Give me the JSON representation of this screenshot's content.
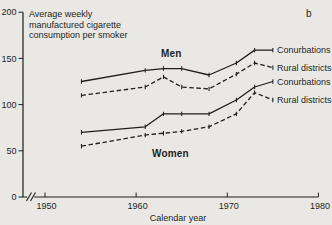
{
  "header": {
    "title_lines": [
      "Average weekly",
      "manufactured cigarette",
      "consumption per smoker"
    ],
    "panel_label": "b"
  },
  "colors": {
    "background": "#e9e8e4",
    "ink": "#1f1f1c"
  },
  "chart_data": {
    "type": "line",
    "title": "Average weekly manufactured cigarette consumption per smoker",
    "xlabel": "Calendar year",
    "ylabel": "",
    "xlim": [
      1947,
      1981
    ],
    "ylim": [
      0,
      200
    ],
    "xticks": [
      1950,
      1960,
      1970,
      1980
    ],
    "yticks": [
      0,
      50,
      100,
      150,
      200
    ],
    "grid": false,
    "x_axis_break_near_origin": true,
    "legend_position": "right-of-lines",
    "x": [
      1954,
      1961,
      1963,
      1965,
      1968,
      1971,
      1973,
      1975
    ],
    "group_labels": [
      "Men",
      "Women"
    ],
    "series": [
      {
        "id": "men-conurbations",
        "group": "Men",
        "label": "Conurbations",
        "style": "solid",
        "values": [
          125,
          137,
          139,
          139,
          132,
          145,
          159,
          159
        ]
      },
      {
        "id": "men-rural-districts",
        "group": "Men",
        "label": "Rural districts",
        "style": "dashed",
        "values": [
          110,
          119,
          130,
          119,
          117,
          133,
          145,
          140
        ]
      },
      {
        "id": "women-conurbations",
        "group": "Women",
        "label": "Conurbations",
        "style": "solid",
        "values": [
          70,
          76,
          90,
          90,
          90,
          105,
          119,
          125
        ]
      },
      {
        "id": "women-rural-districts",
        "group": "Women",
        "label": "Rural districts",
        "style": "dashed",
        "values": [
          55,
          67,
          69,
          71,
          76,
          90,
          113,
          105
        ]
      }
    ]
  }
}
